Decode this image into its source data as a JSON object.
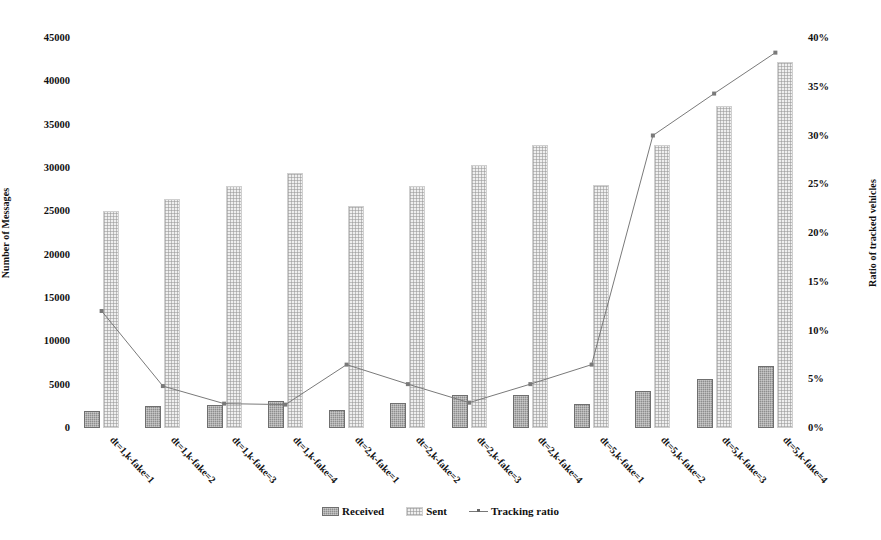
{
  "chart_data": {
    "type": "bar",
    "title": "",
    "xlabel": "",
    "ylabel": "Number of Messages",
    "y2label": "Ratio of tracked vehicles",
    "ylim": [
      0,
      45000
    ],
    "y2lim": [
      0,
      40
    ],
    "grid": false,
    "legend_position": "bottom-center",
    "categories": [
      "dt=1,k-fake=1",
      "dt=1,k-fake=2",
      "dt=1,k-fake=3",
      "dt=1,k-fake=4",
      "dt=2,k-fake=1",
      "dt=2,k-fake=2",
      "dt=2,k-fake=3",
      "dt=2,k-fake=4",
      "dt=5,k-fake=1",
      "dt=5,k-fake=2",
      "dt=5,k-fake=3",
      "dt=5,k-fake=4"
    ],
    "series": [
      {
        "name": "Received",
        "axis": "left",
        "kind": "bar",
        "color": "#8e8e8e",
        "values": [
          2000,
          2500,
          2600,
          3100,
          2100,
          2900,
          3800,
          3800,
          2800,
          4300,
          5700,
          7100
        ]
      },
      {
        "name": "Sent",
        "axis": "left",
        "kind": "bar",
        "color": "#efefef",
        "values": [
          25000,
          26400,
          27900,
          29400,
          25600,
          27900,
          30300,
          32700,
          28000,
          32700,
          37200,
          42200
        ]
      },
      {
        "name": "Tracking ratio",
        "axis": "right",
        "kind": "line",
        "color": "#7a7a7a",
        "values": [
          12.0,
          4.3,
          2.5,
          2.4,
          6.5,
          4.5,
          2.6,
          4.5,
          6.5,
          30.0,
          34.3,
          38.5
        ]
      }
    ],
    "y_ticks": [
      "0",
      "5000",
      "10000",
      "15000",
      "20000",
      "25000",
      "30000",
      "35000",
      "40000",
      "45000"
    ],
    "y2_ticks": [
      "0%",
      "5%",
      "10%",
      "15%",
      "20%",
      "25%",
      "30%",
      "35%",
      "40%"
    ]
  },
  "legend": {
    "items": [
      {
        "label": "Received"
      },
      {
        "label": "Sent"
      },
      {
        "label": "Tracking ratio"
      }
    ]
  }
}
